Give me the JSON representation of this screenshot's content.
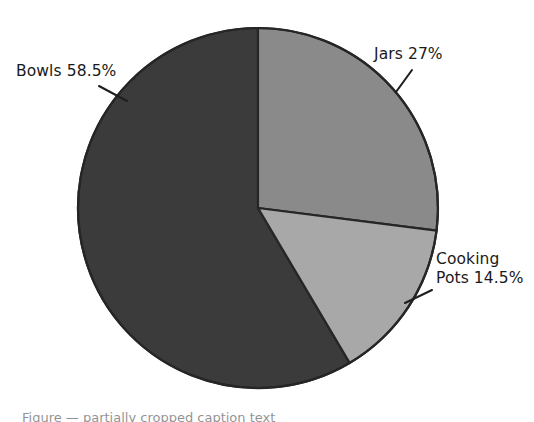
{
  "chart_data": {
    "type": "pie",
    "title": "",
    "subtitle": "",
    "xlabel": "",
    "ylabel": "",
    "legend_position": "none",
    "grid": false,
    "labels_outside": true,
    "leader_lines": true,
    "start_angle_deg": 0,
    "direction": "clockwise",
    "categories": [
      "Jars",
      "Cooking Pots",
      "Bowls"
    ],
    "values": [
      27,
      14.5,
      58.5
    ],
    "value_unit": "%",
    "slices": [
      {
        "name": "jars",
        "label": "Jars 27%",
        "label_lines": [
          "Jars 27%"
        ],
        "category": "Jars",
        "value": 27,
        "value_text": "27%",
        "color": "#8a8a8a",
        "start_deg": 0,
        "end_deg": 97.2
      },
      {
        "name": "cooking-pots",
        "label": "Cooking Pots 14.5%",
        "label_lines": [
          "Cooking",
          "Pots 14.5%"
        ],
        "category": "Cooking Pots",
        "value": 14.5,
        "value_text": "14.5%",
        "color": "#a8a8a8",
        "start_deg": 97.2,
        "end_deg": 149.4
      },
      {
        "name": "bowls",
        "label": "Bowls 58.5%",
        "label_lines": [
          "Bowls 58.5%"
        ],
        "category": "Bowls",
        "value": 58.5,
        "value_text": "58.5%",
        "color": "#3b3b3b",
        "start_deg": 149.4,
        "end_deg": 360
      }
    ],
    "colors": {
      "jars": "#8a8a8a",
      "cooking_pots": "#a8a8a8",
      "bowls": "#3b3b3b",
      "outline": "#262626",
      "background": "#ffffff",
      "label_text": "#1a1a1a"
    }
  },
  "labels": {
    "jars": "Jars 27%",
    "bowls": "Bowls 58.5%",
    "cooking_pots_line1": "Cooking",
    "cooking_pots_line2": "Pots 14.5%"
  },
  "caption": {
    "clipped_text": "Figure — partially cropped caption text"
  }
}
